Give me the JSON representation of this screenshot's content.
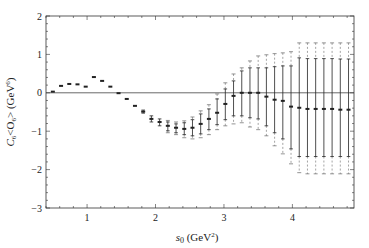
{
  "chart_data": {
    "type": "scatter",
    "subtype": "errorbar",
    "title": "",
    "xlabel": "s0 (GeV2)",
    "xlabel_parts": {
      "main": "s",
      "sub": "0",
      "unit_open": " (GeV",
      "sup": "2",
      "unit_close": ")"
    },
    "ylabel": "C6<O6> (GeV6)",
    "ylabel_parts": {
      "c": "C",
      "c_sub": "6",
      "mid": "<O",
      "o_sub": "6",
      "close": "> (GeV",
      "sup": "6",
      "end": ")"
    },
    "xlim": [
      0.4,
      4.9
    ],
    "ylim": [
      -3,
      2
    ],
    "xticks": [
      1,
      2,
      3,
      4
    ],
    "yticks": [
      2,
      1,
      0,
      -1,
      -2,
      -3
    ],
    "xtick_labels": [
      "1",
      "2",
      "3",
      "4"
    ],
    "ytick_labels": [
      "2",
      "1",
      "0",
      "−1",
      "−2",
      "−3"
    ],
    "grid": false,
    "zero_line": true,
    "legend": null,
    "series": [
      {
        "name": "C6<O6>",
        "points": [
          {
            "x": 0.5,
            "y": 0.03
          },
          {
            "x": 0.62,
            "y": 0.18
          },
          {
            "x": 0.74,
            "y": 0.23
          },
          {
            "x": 0.86,
            "y": 0.22
          },
          {
            "x": 0.98,
            "y": 0.16
          },
          {
            "x": 1.1,
            "y": 0.41
          },
          {
            "x": 1.22,
            "y": 0.31
          },
          {
            "x": 1.34,
            "y": 0.16
          },
          {
            "x": 1.46,
            "y": -0.01
          },
          {
            "x": 1.58,
            "y": -0.16
          },
          {
            "x": 1.7,
            "y": -0.34
          },
          {
            "x": 1.82,
            "y": -0.49,
            "lo": -0.53,
            "hi": -0.45
          },
          {
            "x": 1.94,
            "y": -0.68,
            "lo": -0.76,
            "hi": -0.6
          },
          {
            "x": 2.06,
            "y": -0.76,
            "lo": -0.86,
            "hi": -0.68
          },
          {
            "x": 2.18,
            "y": -0.86,
            "lo": -0.99,
            "hi": -0.76,
            "olo": -1.04,
            "ohi": -0.72
          },
          {
            "x": 2.3,
            "y": -0.91,
            "lo": -1.04,
            "hi": -0.81,
            "olo": -1.09,
            "ohi": -0.76
          },
          {
            "x": 2.42,
            "y": -0.94,
            "lo": -1.09,
            "hi": -0.78,
            "olo": -1.17,
            "ohi": -0.73
          },
          {
            "x": 2.54,
            "y": -0.91,
            "lo": -1.12,
            "hi": -0.7,
            "olo": -1.2,
            "ohi": -0.63
          },
          {
            "x": 2.66,
            "y": -0.81,
            "lo": -1.07,
            "hi": -0.55,
            "olo": -1.17,
            "ohi": -0.47
          },
          {
            "x": 2.78,
            "y": -0.68,
            "lo": -0.96,
            "hi": -0.42,
            "olo": -1.09,
            "ohi": -0.31
          },
          {
            "x": 2.9,
            "y": -0.52,
            "lo": -0.83,
            "hi": -0.16,
            "olo": -0.96,
            "ohi": -0.03
          },
          {
            "x": 3.02,
            "y": -0.29,
            "lo": -0.7,
            "hi": 0.1,
            "olo": -0.86,
            "ohi": 0.26
          },
          {
            "x": 3.14,
            "y": -0.08,
            "lo": -0.6,
            "hi": 0.31,
            "olo": -0.81,
            "ohi": 0.49
          },
          {
            "x": 3.26,
            "y": 0.0,
            "lo": -0.6,
            "hi": 0.57,
            "olo": -0.78,
            "ohi": 0.65
          },
          {
            "x": 3.38,
            "y": 0.0,
            "lo": -0.65,
            "hi": 0.65,
            "olo": -0.89,
            "ohi": 0.83
          },
          {
            "x": 3.5,
            "y": 0.0,
            "lo": -0.68,
            "hi": 0.65,
            "olo": -0.96,
            "ohi": 0.96
          },
          {
            "x": 3.62,
            "y": -0.1,
            "lo": -0.86,
            "hi": 0.65,
            "olo": -1.12,
            "ohi": 0.99
          },
          {
            "x": 3.74,
            "y": -0.18,
            "lo": -1.04,
            "hi": 0.68,
            "olo": -1.38,
            "ohi": 1.02
          },
          {
            "x": 3.86,
            "y": -0.21,
            "lo": -1.2,
            "hi": 0.7,
            "olo": -1.59,
            "ohi": 1.04
          },
          {
            "x": 3.98,
            "y": -0.36,
            "lo": -1.46,
            "hi": 0.7,
            "olo": -1.85,
            "ohi": 1.07
          },
          {
            "x": 4.1,
            "y": -0.39,
            "lo": -1.66,
            "hi": 0.91,
            "olo": -2.08,
            "ohi": 1.3
          },
          {
            "x": 4.22,
            "y": -0.42,
            "lo": -1.66,
            "hi": 0.89,
            "olo": -2.11,
            "ohi": 1.3
          },
          {
            "x": 4.34,
            "y": -0.42,
            "lo": -1.66,
            "hi": 0.89,
            "olo": -2.11,
            "ohi": 1.3
          },
          {
            "x": 4.46,
            "y": -0.42,
            "lo": -1.66,
            "hi": 0.89,
            "olo": -2.11,
            "ohi": 1.3
          },
          {
            "x": 4.58,
            "y": -0.42,
            "lo": -1.66,
            "hi": 0.89,
            "olo": -2.11,
            "ohi": 1.3
          },
          {
            "x": 4.7,
            "y": -0.44,
            "lo": -1.66,
            "hi": 0.88,
            "olo": -2.11,
            "ohi": 1.3
          },
          {
            "x": 4.82,
            "y": -0.44,
            "lo": -1.66,
            "hi": 0.88,
            "olo": -2.11,
            "ohi": 1.3
          }
        ]
      }
    ]
  },
  "colors": {
    "axis": "#333333",
    "data": "#222222",
    "outer_error": "#666666",
    "zero_line": "#444444",
    "background": "#ffffff"
  }
}
